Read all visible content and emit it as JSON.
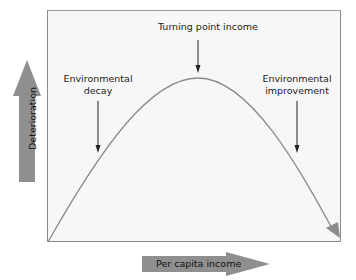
{
  "diagram": {
    "type": "environmental-kuznets-curve",
    "labels": {
      "turning_point": "Turning point income",
      "decay_line1": "Environmental",
      "decay_line2": "decay",
      "improvement_line1": "Environmental",
      "improvement_line2": "improvement"
    },
    "axes": {
      "y_label": "Deterioration",
      "x_label": "Per capita income"
    },
    "colors": {
      "curve": "#8c8c8c",
      "axis_arrow": "#8f8f8f",
      "frame_bg": "#f7f7f7",
      "frame_border": "#8a8a8a",
      "annotation_arrow": "#222222"
    }
  }
}
